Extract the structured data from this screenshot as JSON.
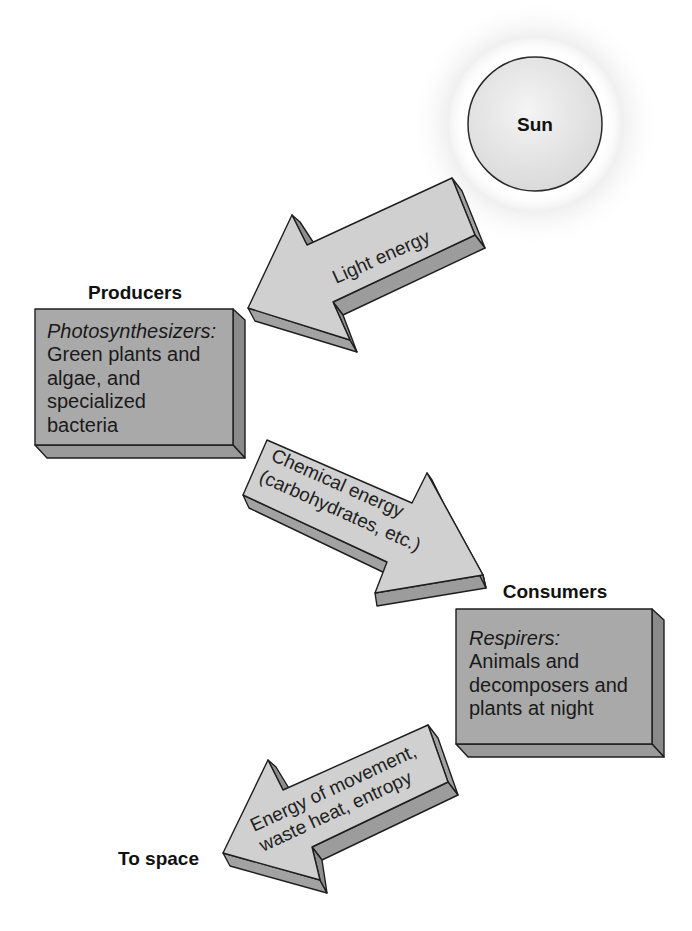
{
  "diagram": {
    "type": "energy-flow",
    "colors": {
      "background": "#ffffff",
      "sun_fill": "#e2e2e2",
      "box_front": "#a9a9a9",
      "box_side": "#8a8a8a",
      "box_bottom": "#9a9a9a",
      "arrow_top": "#d0d0d0",
      "arrow_side": "#a2a2a2",
      "outline": "#1e1e1e"
    },
    "sun": {
      "label": "Sun"
    },
    "arrows": [
      {
        "id": "light",
        "lines": [
          "Light energy"
        ]
      },
      {
        "id": "chemical",
        "lines": [
          "Chemical energy",
          "(carbohydrates, etc.)"
        ]
      },
      {
        "id": "waste",
        "lines": [
          "Energy of movement,",
          "waste heat, entropy"
        ]
      }
    ],
    "producers": {
      "title": "Producers",
      "italic_label": "Photosynthesizers:",
      "lines": [
        "Green plants and",
        "algae, and",
        "specialized",
        "bacteria"
      ]
    },
    "consumers": {
      "title": "Consumers",
      "italic_label": "Respirers:",
      "lines": [
        "Animals and",
        "decomposers and",
        "plants at night"
      ]
    },
    "sink": {
      "label": "To space"
    }
  }
}
